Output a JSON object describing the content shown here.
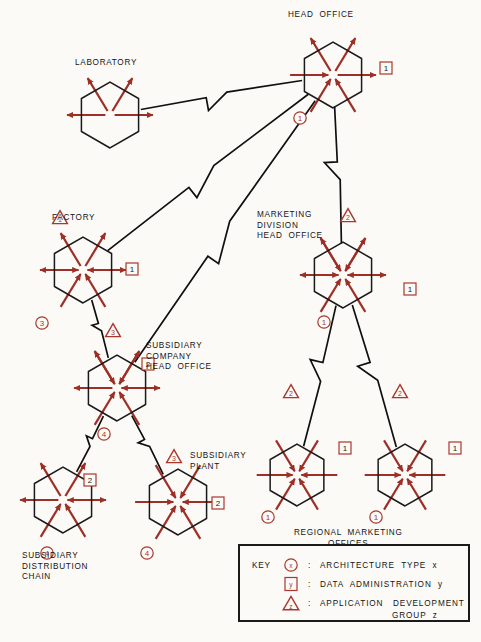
{
  "diagram": {
    "title_nodes": {
      "head_office": "HEAD  OFFICE",
      "laboratory": "LABORATORY",
      "factory": "FACTORY",
      "marketing_division": "MARKETING\nDIVISION\nHEAD  OFFICE",
      "subsidiary_company": "SUBSIDIARY\nCOMPANY\nHEAD  OFFICE",
      "subsidiary_plant": "SUBSIDIARY\nPLANT",
      "subsidiary_distribution": "SUBSIDIARY\nDISTRIBUTION\nCHAIN",
      "regional_marketing": "REGIONAL  MARKETING\nOFFICES"
    },
    "colors": {
      "arrow_red": "#9e2f27",
      "marker_red": "#a8382e",
      "line_black": "#101010",
      "hex_stroke": "#1a1a1a",
      "text": "#141414",
      "background": "#fbfaf7"
    },
    "nodes": [
      {
        "id": "head-office",
        "label": "HEAD  OFFICE",
        "cx": 333,
        "cy": 75,
        "r": 33,
        "arrows": [
          "ul-out",
          "ur-out",
          "l-in",
          "r-out"
        ],
        "lower_arrows": [
          "ll-in",
          "lr-in"
        ],
        "markers": [
          {
            "shape": "circle",
            "value": "1",
            "x": 300,
            "y": 118
          },
          {
            "shape": "square",
            "value": "1",
            "x": 386,
            "y": 68
          }
        ]
      },
      {
        "id": "laboratory",
        "label": "LABORATORY",
        "cx": 110,
        "cy": 115,
        "r": 33,
        "arrows": [
          "ul-out",
          "ur-out",
          "l-out",
          "r-out"
        ],
        "lower_arrows": [],
        "markers": []
      },
      {
        "id": "factory",
        "label": "FACTORY",
        "cx": 83,
        "cy": 270,
        "r": 33,
        "arrows": [
          "ul-out",
          "ur-out",
          "l-out",
          "r-out",
          "l-in",
          "r-in"
        ],
        "lower_arrows": [
          "ll-in",
          "lr-in"
        ],
        "markers": [
          {
            "shape": "circle",
            "value": "3",
            "x": 42,
            "y": 323
          },
          {
            "shape": "triangle",
            "value": "1",
            "x": 60,
            "y": 218
          },
          {
            "shape": "square",
            "value": "1",
            "x": 132,
            "y": 269
          }
        ]
      },
      {
        "id": "marketing-division",
        "label": "MARKETING\nDIVISION\nHEAD  OFFICE",
        "cx": 343,
        "cy": 275,
        "r": 33,
        "arrows": [
          "ul-out",
          "ur-out",
          "ul-in",
          "ur-in",
          "l-out",
          "r-out",
          "l-in",
          "r-in"
        ],
        "lower_arrows": [
          "ll-in",
          "lr-in"
        ],
        "markers": [
          {
            "shape": "triangle",
            "value": "2",
            "x": 348,
            "y": 216
          },
          {
            "shape": "circle",
            "value": "1",
            "x": 324,
            "y": 322
          },
          {
            "shape": "square",
            "value": "1",
            "x": 410,
            "y": 289
          }
        ]
      },
      {
        "id": "subsidiary-company",
        "label": "SUBSIDIARY\nCOMPANY\nHEAD  OFFICE",
        "cx": 117,
        "cy": 388,
        "r": 33,
        "arrows": [
          "ul-out",
          "ur-out",
          "ul-in",
          "ur-in",
          "l-out",
          "r-out",
          "r-in"
        ],
        "lower_arrows": [
          "ll-in",
          "lr-in"
        ],
        "markers": [
          {
            "shape": "triangle",
            "value": "3",
            "x": 113,
            "y": 331
          },
          {
            "shape": "square",
            "value": "2",
            "x": 148,
            "y": 364
          },
          {
            "shape": "circle",
            "value": "4",
            "x": 104,
            "y": 434
          }
        ]
      },
      {
        "id": "subsidiary-distribution",
        "label": "SUBSIDIARY\nDISTRIBUTION\nCHAIN",
        "cx": 63,
        "cy": 500,
        "r": 33,
        "arrows": [
          "ul-out",
          "ur-out",
          "l-out",
          "r-out",
          "r-in"
        ],
        "lower_arrows": [
          "ll-in",
          "lr-in"
        ],
        "markers": [
          {
            "shape": "square",
            "value": "2",
            "x": 90,
            "y": 480
          },
          {
            "shape": "circle",
            "value": "4",
            "x": 47,
            "y": 553
          }
        ]
      },
      {
        "id": "subsidiary-plant",
        "label": "SUBSIDIARY\nPLANT",
        "cx": 178,
        "cy": 502,
        "r": 33,
        "arrows": [
          "ul-in",
          "ur-in",
          "l-in",
          "r-in"
        ],
        "lower_arrows": [
          "ll-in",
          "lr-in"
        ],
        "markers": [
          {
            "shape": "triangle",
            "value": "3",
            "x": 174,
            "y": 457
          },
          {
            "shape": "square",
            "value": "2",
            "x": 218,
            "y": 503
          },
          {
            "shape": "circle",
            "value": "4",
            "x": 147,
            "y": 553
          }
        ]
      },
      {
        "id": "regional-marketing-1",
        "label": "",
        "cx": 297,
        "cy": 475,
        "r": 31,
        "arrows": [
          "ul-in",
          "ur-in",
          "l-in",
          "r-in"
        ],
        "lower_arrows": [
          "ll-in",
          "lr-in"
        ],
        "markers": [
          {
            "shape": "triangle",
            "value": "2",
            "x": 291,
            "y": 392
          },
          {
            "shape": "circle",
            "value": "1",
            "x": 268,
            "y": 517
          },
          {
            "shape": "square",
            "value": "1",
            "x": 345,
            "y": 448
          }
        ]
      },
      {
        "id": "regional-marketing-2",
        "label": "",
        "cx": 405,
        "cy": 475,
        "r": 31,
        "arrows": [
          "ul-in",
          "ur-in",
          "l-in",
          "r-in"
        ],
        "lower_arrows": [
          "ll-in",
          "lr-in"
        ],
        "markers": [
          {
            "shape": "triangle",
            "value": "2",
            "x": 400,
            "y": 392
          },
          {
            "shape": "circle",
            "value": "1",
            "x": 376,
            "y": 517
          },
          {
            "shape": "square",
            "value": "1",
            "x": 455,
            "y": 448
          }
        ]
      }
    ],
    "links": [
      {
        "from": "laboratory",
        "to": "head-office"
      },
      {
        "from": "factory",
        "to": "head-office"
      },
      {
        "from": "subsidiary-company",
        "to": "head-office"
      },
      {
        "from": "head-office",
        "to": "marketing-division"
      },
      {
        "from": "factory",
        "to": "subsidiary-company"
      },
      {
        "from": "subsidiary-company",
        "to": "subsidiary-distribution"
      },
      {
        "from": "subsidiary-company",
        "to": "subsidiary-plant"
      },
      {
        "from": "marketing-division",
        "to": "regional-marketing-1"
      },
      {
        "from": "marketing-division",
        "to": "regional-marketing-2"
      }
    ]
  },
  "key": {
    "title": "KEY",
    "rows": [
      {
        "shape": "circle",
        "symbol": "x",
        "colon": ":",
        "text": "ARCHITECTURE  TYPE  x"
      },
      {
        "shape": "square",
        "symbol": "y",
        "colon": ":",
        "text": "DATA  ADMINISTRATION  y"
      },
      {
        "shape": "triangle",
        "symbol": "z",
        "colon": ":",
        "text": "APPLICATION   DEVELOPMENT",
        "text2": "GROUP  z"
      }
    ]
  }
}
